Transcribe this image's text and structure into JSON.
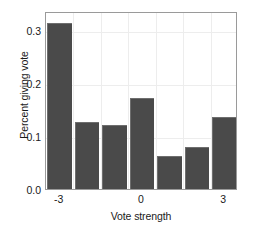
{
  "chart_data": {
    "type": "bar",
    "title": "",
    "xlabel": "Vote strength",
    "ylabel": "Percent giving vote",
    "categories": [
      "-3",
      "-2",
      "-1",
      "0",
      "1",
      "2",
      "3"
    ],
    "values": [
      0.313,
      0.126,
      0.121,
      0.171,
      0.062,
      0.08,
      0.136
    ],
    "ylim": [
      0,
      0.335
    ],
    "yticks": [
      0.0,
      0.1,
      0.2,
      0.3
    ],
    "ytick_labels": [
      "0.0",
      "0.1",
      "0.2",
      "0.3"
    ],
    "xticks": [
      "-3",
      "0",
      "3"
    ],
    "xtick_positions": [
      0,
      3,
      6
    ],
    "grid": true,
    "legend": "none",
    "bar_color": "#4a4a4a",
    "bar_edge_color": "#6e6e6e",
    "background_color": "#ffffff",
    "frame_color": "#9a9a9a",
    "gridline_color": "#ededed"
  }
}
